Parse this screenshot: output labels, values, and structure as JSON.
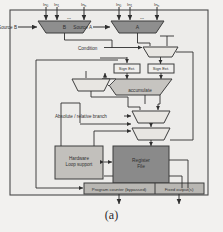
{
  "figure": {
    "caption": "(a)",
    "background": "#f2f1ef",
    "border_color": "#4a4a4a"
  },
  "inputs": {
    "left_group": [
      "In",
      "In",
      "In"
    ],
    "left_subs": [
      "0",
      "1",
      "n"
    ],
    "right_group": [
      "In",
      "In",
      "In"
    ],
    "right_subs": [
      "0",
      "1",
      "n"
    ]
  },
  "labels": {
    "source_b": "Source B",
    "source_a": "Source A",
    "condition": "Condition",
    "absolute_relative_branch": "Absolute / relative branch"
  },
  "blocks": {
    "mux_b": "B",
    "mux_a": "A",
    "sign_ext_left": "Sign Ext.",
    "sign_ext_right": "Sign Ext.",
    "accumulate": "accumulate",
    "hardware_loop_line1": "Hardware",
    "hardware_loop_line2": "Loop support",
    "register_file_line1": "Register",
    "register_file_line2": "File",
    "program_counter": "Program counter (bypassed)",
    "fixed_outputs": "Fixed output(s)"
  },
  "colors": {
    "mux_dark": "#8e8e8e",
    "mux_light": "#e8e6e2",
    "accumulate_fill": "#c6c4c0",
    "register_file_fill": "#8a8a8a",
    "hw_loop_fill": "#c2c0bc",
    "bottom_bar_fill": "#b9b7b3",
    "stroke": "#3d3d3d"
  }
}
